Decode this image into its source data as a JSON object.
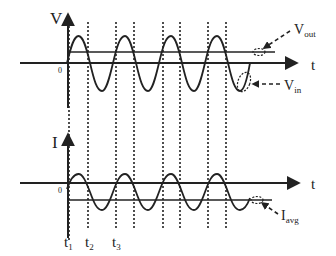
{
  "figure": {
    "type": "voltage and current waveforms",
    "top_plot": {
      "y_axis_label": "V",
      "x_axis_label": "t",
      "origin_label": "0",
      "curves": [
        {
          "name": "V_in",
          "label_main": "V",
          "label_sub": "in",
          "shape": "sinusoid",
          "amplitude_px": 28
        },
        {
          "name": "V_out",
          "label_main": "V",
          "label_sub": "out",
          "shape": "horizontal line above axis"
        }
      ]
    },
    "bottom_plot": {
      "y_axis_label": "I",
      "x_axis_label": "t",
      "origin_label": "0",
      "curves": [
        {
          "name": "I",
          "shape": "sinusoid offset below axis",
          "amplitude_px": 18
        },
        {
          "name": "I_avg",
          "label_main": "I",
          "label_sub": "avg",
          "shape": "horizontal line below axis"
        }
      ]
    },
    "time_markers": [
      {
        "label_main": "t",
        "label_sub": "1"
      },
      {
        "label_main": "t",
        "label_sub": "2"
      },
      {
        "label_main": "t",
        "label_sub": "3"
      }
    ],
    "dotted_line_count": 8,
    "colors": {
      "ink": "#222222",
      "background": "#ffffff"
    }
  }
}
